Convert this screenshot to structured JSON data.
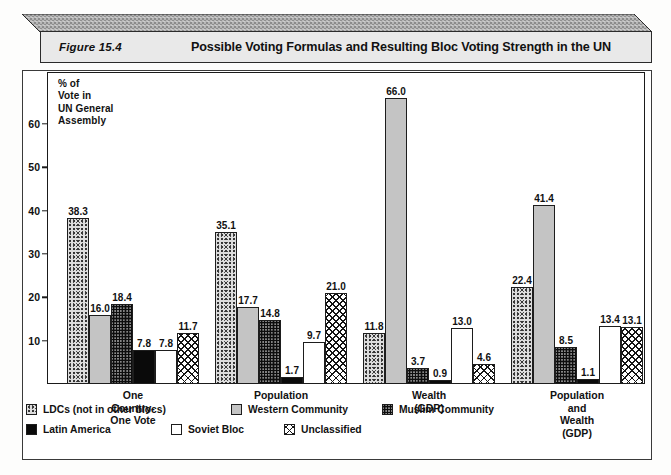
{
  "banner": {
    "figure_number": "Figure 15.4",
    "title": "Possible Voting Formulas and Resulting Bloc Voting Strength in the UN"
  },
  "chart_data": {
    "type": "bar",
    "title": "Possible Voting Formulas and Resulting Bloc Voting Strength in the UN",
    "xlabel": "",
    "ylabel": "% of\nVote in\nUN General\nAssembly",
    "ylim": [
      0,
      70
    ],
    "yticks": [
      10,
      20,
      30,
      40,
      50,
      60
    ],
    "grid": false,
    "legend_position": "bottom-left",
    "categories": [
      "One Country-\nOne Vote",
      "Population",
      "Wealth (GDP)",
      "Population and\nWealth (GDP)"
    ],
    "series": [
      {
        "name": "LDCs (not in other blocs)",
        "fill": "f-ldc",
        "color": "#dcdcdc",
        "values": [
          38.3,
          35.1,
          11.8,
          22.4
        ]
      },
      {
        "name": "Western Community",
        "fill": "f-west",
        "color": "#c4c4c4",
        "values": [
          16.0,
          17.7,
          66.0,
          41.4
        ]
      },
      {
        "name": "Muslim Community",
        "fill": "f-muslim",
        "color": "#8d8d8d",
        "values": [
          18.4,
          14.8,
          3.7,
          8.5
        ]
      },
      {
        "name": "Latin America",
        "fill": "f-latin",
        "color": "#0a0a0a",
        "values": [
          7.8,
          1.7,
          0.9,
          1.1
        ]
      },
      {
        "name": "Soviet Bloc",
        "fill": "f-soviet",
        "color": "#ffffff",
        "values": [
          7.8,
          9.7,
          13.0,
          13.4
        ]
      },
      {
        "name": "Unclassified",
        "fill": "f-unclass",
        "color": "#ffffff",
        "values": [
          11.7,
          21.0,
          4.6,
          13.1
        ]
      }
    ],
    "value_labels": [
      [
        "38.3",
        "16.0",
        "18.4",
        "7.8",
        "7.8",
        "11.7"
      ],
      [
        "35.1",
        "17.7",
        "14.8",
        "1.7",
        "9.7",
        "21.0"
      ],
      [
        "11.8",
        "66.0",
        "3.7",
        "0.9",
        "13.0",
        "4.6"
      ],
      [
        "22.4",
        "41.4",
        "8.5",
        "1.1",
        "13.4",
        "13.1"
      ]
    ]
  },
  "legend": {
    "row1": [
      {
        "label": "LDCs (not in other blocs)",
        "swatch": "f-ldc",
        "left": 0
      },
      {
        "label": "Western Community",
        "swatch": "f-west",
        "left": 205
      },
      {
        "label": "Muslim Community",
        "swatch": "f-muslim",
        "left": 356
      }
    ],
    "row2": [
      {
        "label": "Latin America",
        "swatch": "f-latin",
        "left": 0
      },
      {
        "label": "Soviet Bloc",
        "swatch": "f-soviet",
        "left": 145
      },
      {
        "label": "Unclassified",
        "swatch": "f-unclass",
        "left": 258
      }
    ]
  }
}
